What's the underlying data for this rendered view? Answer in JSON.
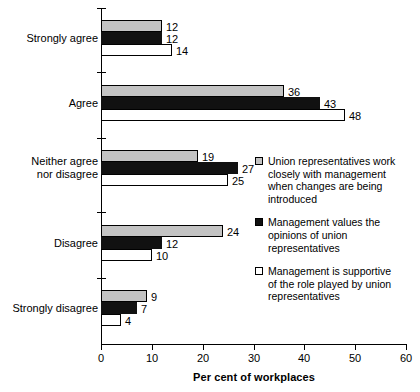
{
  "chart_data": {
    "type": "bar",
    "orientation": "horizontal",
    "title": "",
    "xlabel": "Per cent of workplaces",
    "ylabel": "",
    "xlim": [
      0,
      60
    ],
    "xticks": [
      0,
      10,
      20,
      30,
      40,
      50,
      60
    ],
    "xtick_labels": [
      "0",
      "10",
      "20",
      "30",
      "40",
      "50",
      "60"
    ],
    "grid": false,
    "legend_position": "right-middle",
    "categories": [
      "Strongly agree",
      "Agree",
      "Neither agree nor disagree",
      "Disagree",
      "Strongly disagree"
    ],
    "category_lines": [
      [
        "Strongly agree"
      ],
      [
        "Agree"
      ],
      [
        "Neither agree",
        "nor disagree"
      ],
      [
        "Disagree"
      ],
      [
        "Strongly disagree"
      ]
    ],
    "series": [
      {
        "name": "Union representatives work closely with management when changes are being introduced",
        "name_lines": [
          "Union representatives work",
          "closely with management",
          "when changes are being",
          "introduced"
        ],
        "color": "#c3c3c3",
        "values": [
          12,
          36,
          19,
          24,
          9
        ]
      },
      {
        "name": "Management values the opinions of union representatives",
        "name_lines": [
          "Management values the",
          "opinions of union",
          "representatives"
        ],
        "color": "#111111",
        "values": [
          12,
          43,
          27,
          12,
          7
        ]
      },
      {
        "name": "Management is supportive of the role played by union representatives",
        "name_lines": [
          "Management is supportive",
          "of the role played by union",
          "representatives"
        ],
        "color": "#ffffff",
        "values": [
          14,
          48,
          25,
          10,
          4
        ]
      }
    ]
  }
}
